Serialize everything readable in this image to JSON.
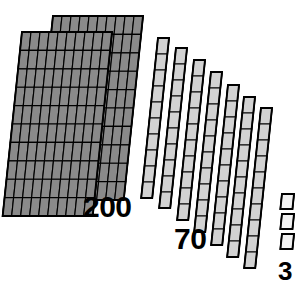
{
  "scene": {
    "title": "Base-Ten Blocks Place Value Model",
    "total_value": 273,
    "background_color": "#ffffff",
    "outline_color": "#000000"
  },
  "labels": {
    "hundreds": "200",
    "tens": "70",
    "ones": "3"
  },
  "groups": [
    {
      "name": "hundreds-flats",
      "label": "200",
      "piece_type": "flat",
      "piece_count": 2,
      "unit_value": 100,
      "group_value": 200,
      "rows": 10,
      "cols": 10,
      "fill_color": "#8a8a8a",
      "stroke_color": "#000000"
    },
    {
      "name": "tens-rods",
      "label": "70",
      "piece_type": "rod",
      "piece_count": 7,
      "unit_value": 10,
      "group_value": 70,
      "rows": 10,
      "cols": 1,
      "fill_color": "#d2d2d2",
      "stroke_color": "#000000"
    },
    {
      "name": "ones-units",
      "label": "3",
      "piece_type": "unit",
      "piece_count": 3,
      "unit_value": 1,
      "group_value": 3,
      "rows": 1,
      "cols": 1,
      "fill_color": "#f2f2f2",
      "stroke_color": "#000000"
    }
  ],
  "geometry": {
    "shear_x": -0.105,
    "flats": [
      {
        "id": "flat-back",
        "x": 53,
        "y": 16,
        "w": 90,
        "h": 184
      },
      {
        "id": "flat-front",
        "x": 22,
        "y": 32,
        "w": 90,
        "h": 184
      }
    ],
    "rods": [
      {
        "id": "rod-1",
        "x": 158,
        "y": 38,
        "w": 11,
        "h": 160
      },
      {
        "id": "rod-2",
        "x": 176,
        "y": 48,
        "w": 11,
        "h": 160
      },
      {
        "id": "rod-3",
        "x": 194,
        "y": 60,
        "w": 11,
        "h": 160
      },
      {
        "id": "rod-4",
        "x": 211,
        "y": 72,
        "w": 11,
        "h": 160
      },
      {
        "id": "rod-5",
        "x": 228,
        "y": 85,
        "w": 11,
        "h": 160
      },
      {
        "id": "rod-6",
        "x": 244,
        "y": 97,
        "w": 11,
        "h": 160
      },
      {
        "id": "rod-7",
        "x": 261,
        "y": 108,
        "w": 11,
        "h": 160
      }
    ],
    "units": [
      {
        "id": "unit-1",
        "x": 282,
        "y": 194,
        "w": 12,
        "h": 15
      },
      {
        "id": "unit-2",
        "x": 282,
        "y": 214,
        "w": 12,
        "h": 15
      },
      {
        "id": "unit-3",
        "x": 282,
        "y": 234,
        "w": 12,
        "h": 15
      }
    ]
  }
}
